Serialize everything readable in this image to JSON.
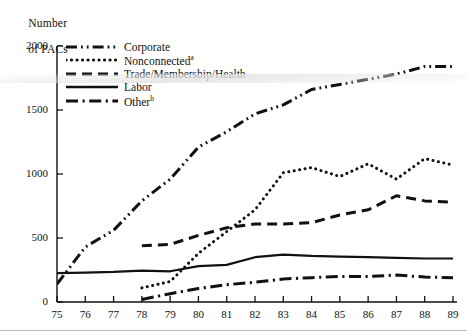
{
  "chart_data": {
    "type": "line",
    "title": "",
    "ylabel": "Number of PACs",
    "xlabel": "",
    "ylim": [
      0,
      2000
    ],
    "yticks": [
      0,
      500,
      1000,
      1500,
      2000
    ],
    "grid": false,
    "legend_position": "top-left",
    "categories": [
      "75",
      "76",
      "77",
      "78",
      "79",
      "80",
      "81",
      "82",
      "83",
      "84",
      "85",
      "86",
      "87",
      "88",
      "89"
    ],
    "series": [
      {
        "name": "Corporate",
        "style": "dash-dot-dot",
        "values": [
          140,
          430,
          560,
          790,
          960,
          1210,
          1330,
          1470,
          1540,
          1660,
          1700,
          1740,
          1780,
          1840,
          1840
        ]
      },
      {
        "name": "Nonconnected",
        "style": "dotted",
        "footnote": "a",
        "values": [
          null,
          null,
          null,
          110,
          160,
          380,
          550,
          720,
          1010,
          1050,
          980,
          1080,
          960,
          1120,
          1070
        ]
      },
      {
        "name": "Trade/Membership/Health",
        "style": "dashed",
        "values": [
          null,
          null,
          null,
          440,
          450,
          520,
          580,
          610,
          610,
          620,
          680,
          720,
          830,
          790,
          780
        ]
      },
      {
        "name": "Labor",
        "style": "solid",
        "values": [
          225,
          230,
          235,
          245,
          240,
          280,
          290,
          350,
          370,
          360,
          355,
          350,
          345,
          340,
          340
        ]
      },
      {
        "name": "Other",
        "style": "dash-dot",
        "footnote": "b",
        "values": [
          null,
          null,
          null,
          20,
          65,
          105,
          135,
          155,
          180,
          190,
          200,
          200,
          210,
          195,
          190
        ]
      }
    ]
  },
  "legend": {
    "items": [
      {
        "label": "Corporate",
        "footnote": ""
      },
      {
        "label": "Nonconnected",
        "footnote": "a"
      },
      {
        "label": "Trade/Membership/Health",
        "footnote": ""
      },
      {
        "label": "Labor",
        "footnote": ""
      },
      {
        "label": "Other",
        "footnote": "b"
      }
    ]
  },
  "axis": {
    "y_title_line1": "Number",
    "y_title_line2": "of PACs"
  },
  "colors": {
    "ink": "#111111",
    "background": "#ffffff"
  }
}
